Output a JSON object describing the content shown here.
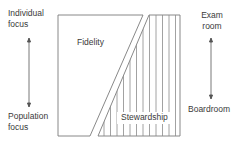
{
  "left_axis": {
    "top_label_line1": "Individual",
    "top_label_line2": "focus",
    "bottom_label_line1": "Population",
    "bottom_label_line2": "focus",
    "arrow": "double-headed-vertical-arrow"
  },
  "right_axis": {
    "top_label_line1": "Exam",
    "top_label_line2": "room",
    "bottom_label": "Boardroom",
    "arrow": "double-headed-vertical-arrow"
  },
  "box": {
    "region_upper_left_label": "Fidelity",
    "region_lower_right_label": "Stewardship",
    "stroke_color": "#7a7a7a"
  }
}
